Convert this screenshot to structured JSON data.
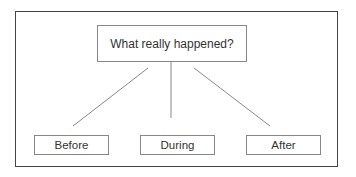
{
  "diagram": {
    "root": {
      "label": "What really happened?"
    },
    "children": [
      {
        "label": "Before"
      },
      {
        "label": "During"
      },
      {
        "label": "After"
      }
    ],
    "colors": {
      "frame": "#444444",
      "box_border": "#888888",
      "line": "#888888",
      "text": "#333333"
    }
  }
}
